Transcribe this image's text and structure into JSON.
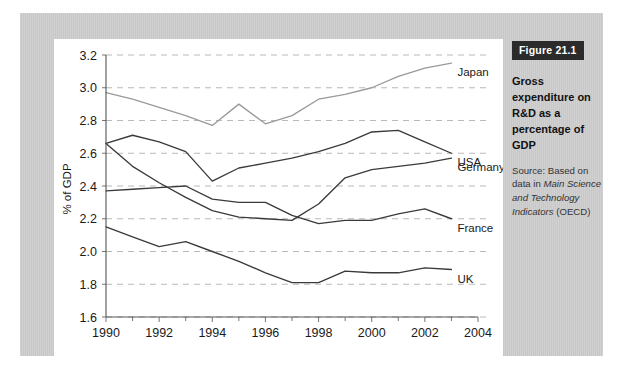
{
  "figure": {
    "badge_label": "Figure 21.1",
    "title": "Gross expenditure on R&D as a percentage of GDP",
    "source_prefix": "Source: Based on data in ",
    "source_italic_1": "Main Science and Technology Indicators",
    "source_suffix": " (OECD)"
  },
  "colors": {
    "mat": "#c8c8c8",
    "card": "#ffffff",
    "badge_bg": "#2b2b2b",
    "badge_text": "#ffffff",
    "gridline": "#b9b9b9",
    "axis": "#555555",
    "japan": "#9a9a9a",
    "usa": "#3a3a3a",
    "germany": "#3a3a3a",
    "france": "#3a3a3a",
    "uk": "#3a3a3a"
  },
  "chart_data": {
    "type": "line",
    "title": "Gross expenditure on R&D as a percentage of GDP",
    "xlabel": "",
    "ylabel": "% of GDP",
    "xlim": [
      1990,
      2004
    ],
    "ylim": [
      1.6,
      3.2
    ],
    "grid": true,
    "legend_position": "right-end-of-line",
    "x_ticks": [
      1990,
      1992,
      1994,
      1996,
      1998,
      2000,
      2002,
      2004
    ],
    "x_tick_labels": [
      "1990",
      "1992",
      "1994",
      "1996",
      "1998",
      "2000",
      "2002",
      "2004"
    ],
    "x_minor_ticks": [
      1991,
      1993,
      1995,
      1997,
      1999,
      2001,
      2003
    ],
    "y_ticks": [
      1.6,
      1.8,
      2.0,
      2.2,
      2.4,
      2.6,
      2.8,
      3.0,
      3.2
    ],
    "y_tick_labels": [
      "1.6",
      "1.8",
      "2.0",
      "2.2",
      "2.4",
      "2.6",
      "2.8",
      "3.0",
      "3.2"
    ],
    "x": [
      1990,
      1991,
      1992,
      1993,
      1994,
      1995,
      1996,
      1997,
      1998,
      1999,
      2000,
      2001,
      2002,
      2003
    ],
    "series": [
      {
        "name": "Japan",
        "color": "#9a9a9a",
        "values": [
          2.97,
          2.93,
          2.88,
          2.83,
          2.77,
          2.9,
          2.78,
          2.83,
          2.93,
          2.96,
          3.0,
          3.07,
          3.12,
          3.15
        ]
      },
      {
        "name": "USA",
        "color": "#3a3a3a",
        "values": [
          2.66,
          2.71,
          2.67,
          2.61,
          2.43,
          2.51,
          2.54,
          2.57,
          2.61,
          2.66,
          2.73,
          2.74,
          2.67,
          2.6
        ]
      },
      {
        "name": "Germany",
        "color": "#3a3a3a",
        "values": [
          2.66,
          2.52,
          2.42,
          2.33,
          2.25,
          2.21,
          2.2,
          2.19,
          2.29,
          2.45,
          2.5,
          2.52,
          2.54,
          2.57
        ]
      },
      {
        "name": "France",
        "color": "#3a3a3a",
        "values": [
          2.37,
          2.38,
          2.39,
          2.4,
          2.32,
          2.3,
          2.3,
          2.22,
          2.17,
          2.19,
          2.19,
          2.23,
          2.26,
          2.2
        ]
      },
      {
        "name": "UK",
        "color": "#3a3a3a",
        "values": [
          2.15,
          2.09,
          2.03,
          2.06,
          2.0,
          1.94,
          1.87,
          1.81,
          1.81,
          1.88,
          1.87,
          1.87,
          1.9,
          1.89
        ]
      }
    ]
  }
}
